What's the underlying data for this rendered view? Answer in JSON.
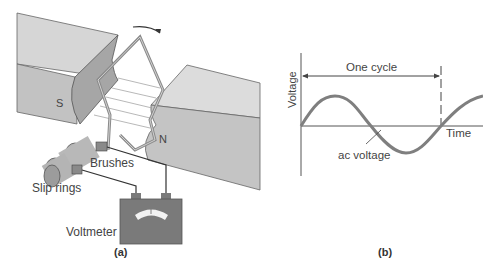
{
  "figure_a": {
    "caption": "(a)",
    "labels": {
      "south_pole": "S",
      "north_pole": "N",
      "brushes": "Brushes",
      "slip_rings": "Slip rings",
      "voltmeter": "Voltmeter"
    }
  },
  "figure_b": {
    "caption": "(b)",
    "labels": {
      "y_axis": "Voltage",
      "x_axis": "Time",
      "cycle": "One cycle",
      "curve": "ac voltage"
    }
  },
  "colors": {
    "magnet_top": "#d6d6d6",
    "magnet_side": "#bdbdbd",
    "magnet_face": "#a8a8a8",
    "wire": "#777777",
    "meter": "#7a7a7a",
    "curve": "#7f7f7f",
    "axis": "#555555"
  }
}
